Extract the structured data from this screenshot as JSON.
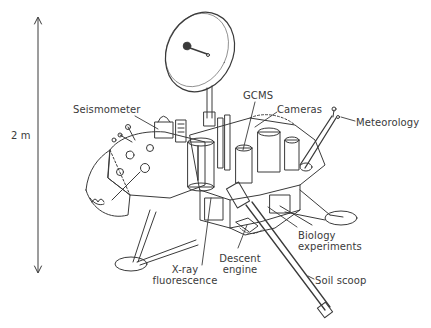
{
  "diagram": {
    "scale": {
      "label": "2 m",
      "orientation": "vertical double arrow"
    },
    "labels": [
      {
        "id": "seismometer",
        "text": "Seismometer"
      },
      {
        "id": "gcms",
        "text": "GCMS"
      },
      {
        "id": "cameras",
        "text": "Cameras"
      },
      {
        "id": "meteorology",
        "text": "Meteorology"
      },
      {
        "id": "biology",
        "lines": [
          "Biology",
          "experiments"
        ]
      },
      {
        "id": "descent",
        "lines": [
          "Descent",
          "engine"
        ]
      },
      {
        "id": "xray",
        "lines": [
          "X-ray",
          "fluorescence"
        ]
      },
      {
        "id": "soil",
        "text": "Soil scoop"
      }
    ],
    "colors": {
      "ink": "#3a3a3a",
      "background": "#ffffff"
    }
  }
}
